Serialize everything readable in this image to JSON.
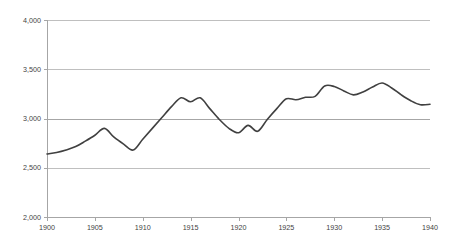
{
  "chart_data": {
    "type": "line",
    "title": "",
    "subtitle": "",
    "xlabel": "",
    "ylabel": "",
    "xlim": [
      1900,
      1940
    ],
    "ylim": [
      2000,
      4000
    ],
    "grid": true,
    "legend": null,
    "legend_position": "none",
    "y_ticks": [
      2000,
      2500,
      3000,
      3500,
      4000
    ],
    "y_tick_labels": [
      "2,000",
      "2,500",
      "3,000",
      "3,500",
      "4,000"
    ],
    "x_ticks": [
      1900,
      1905,
      1910,
      1915,
      1920,
      1925,
      1930,
      1935,
      1940
    ],
    "x_tick_labels": [
      "1900",
      "1905",
      "1910",
      "1915",
      "1920",
      "1925",
      "1930",
      "1935",
      "1940"
    ],
    "x": [
      1900,
      1901,
      1902,
      1903,
      1904,
      1905,
      1906,
      1907,
      1908,
      1909,
      1910,
      1911,
      1912,
      1913,
      1914,
      1915,
      1916,
      1917,
      1918,
      1919,
      1920,
      1921,
      1922,
      1923,
      1924,
      1925,
      1926,
      1927,
      1928,
      1929,
      1930,
      1931,
      1932,
      1933,
      1934,
      1935,
      1936,
      1937,
      1938,
      1939,
      1940
    ],
    "values": [
      2640,
      2655,
      2680,
      2715,
      2770,
      2830,
      2900,
      2810,
      2740,
      2680,
      2790,
      2900,
      3010,
      3120,
      3210,
      3170,
      3210,
      3100,
      2990,
      2900,
      2855,
      2930,
      2870,
      2990,
      3100,
      3200,
      3190,
      3215,
      3225,
      3330,
      3325,
      3280,
      3240,
      3270,
      3320,
      3360,
      3310,
      3240,
      3180,
      3140,
      3145
    ],
    "series_name": "value",
    "series_color": "#404040",
    "gridline_color": "#bfbfbf",
    "axis_color": "#a6a6a6",
    "background_color": "#ffffff"
  },
  "layout": {
    "plot_left": 47,
    "plot_right": 430,
    "plot_top": 20,
    "plot_bottom": 217,
    "width": 455,
    "height": 251
  }
}
